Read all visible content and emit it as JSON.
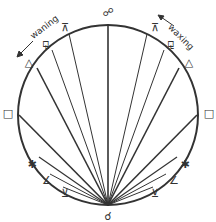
{
  "diagram": {
    "circle": {
      "cx": 108,
      "cy": 115,
      "r": 90,
      "stroke": "#333333"
    },
    "origin": {
      "x": 108,
      "y": 205
    },
    "labels": {
      "waning": "waning",
      "waxing": "waxing"
    },
    "aspects": [
      {
        "name": "opposition",
        "glyph": "☍",
        "angle": 180,
        "side": "top",
        "pos": [
          108,
          12
        ]
      },
      {
        "name": "quincunx-waning",
        "glyph": "⊼",
        "angle": 150,
        "side": "left",
        "pos": [
          65,
          27
        ]
      },
      {
        "name": "quincunx-waxing",
        "glyph": "⊼",
        "angle": 150,
        "side": "right",
        "pos": [
          155,
          27
        ]
      },
      {
        "name": "sesquiquadrate-waning",
        "glyph": "⚼",
        "angle": 135,
        "side": "left",
        "pos": [
          46,
          43
        ]
      },
      {
        "name": "sesquiquadrate-waxing",
        "glyph": "⚼",
        "angle": 135,
        "side": "right",
        "pos": [
          171,
          43
        ]
      },
      {
        "name": "trine-waning",
        "glyph": "△",
        "angle": 120,
        "side": "left",
        "pos": [
          29,
          62
        ]
      },
      {
        "name": "trine-waxing",
        "glyph": "△",
        "angle": 120,
        "side": "right",
        "pos": [
          189,
          62
        ]
      },
      {
        "name": "square-waning",
        "glyph": "□",
        "angle": 90,
        "side": "left",
        "pos": [
          8,
          113
        ]
      },
      {
        "name": "square-waxing",
        "glyph": "□",
        "angle": 90,
        "side": "right",
        "pos": [
          209,
          113
        ]
      },
      {
        "name": "sextile-waning",
        "glyph": "✱",
        "angle": 60,
        "side": "left",
        "pos": [
          32,
          164
        ]
      },
      {
        "name": "sextile-waxing",
        "glyph": "✱",
        "angle": 60,
        "side": "right",
        "pos": [
          185,
          164
        ]
      },
      {
        "name": "semisquare-waning",
        "glyph": "∠",
        "angle": 45,
        "side": "left",
        "pos": [
          47,
          180
        ]
      },
      {
        "name": "semisquare-waxing",
        "glyph": "∠",
        "angle": 45,
        "side": "right",
        "pos": [
          174,
          180
        ]
      },
      {
        "name": "semisextile-waning",
        "glyph": "⊻",
        "angle": 30,
        "side": "left",
        "pos": [
          65,
          193
        ]
      },
      {
        "name": "semisextile-waxing",
        "glyph": "⊻",
        "angle": 30,
        "side": "right",
        "pos": [
          155,
          193
        ]
      },
      {
        "name": "conjunction",
        "glyph": "☌",
        "angle": 0,
        "side": "bottom",
        "pos": [
          108,
          216
        ]
      }
    ]
  }
}
